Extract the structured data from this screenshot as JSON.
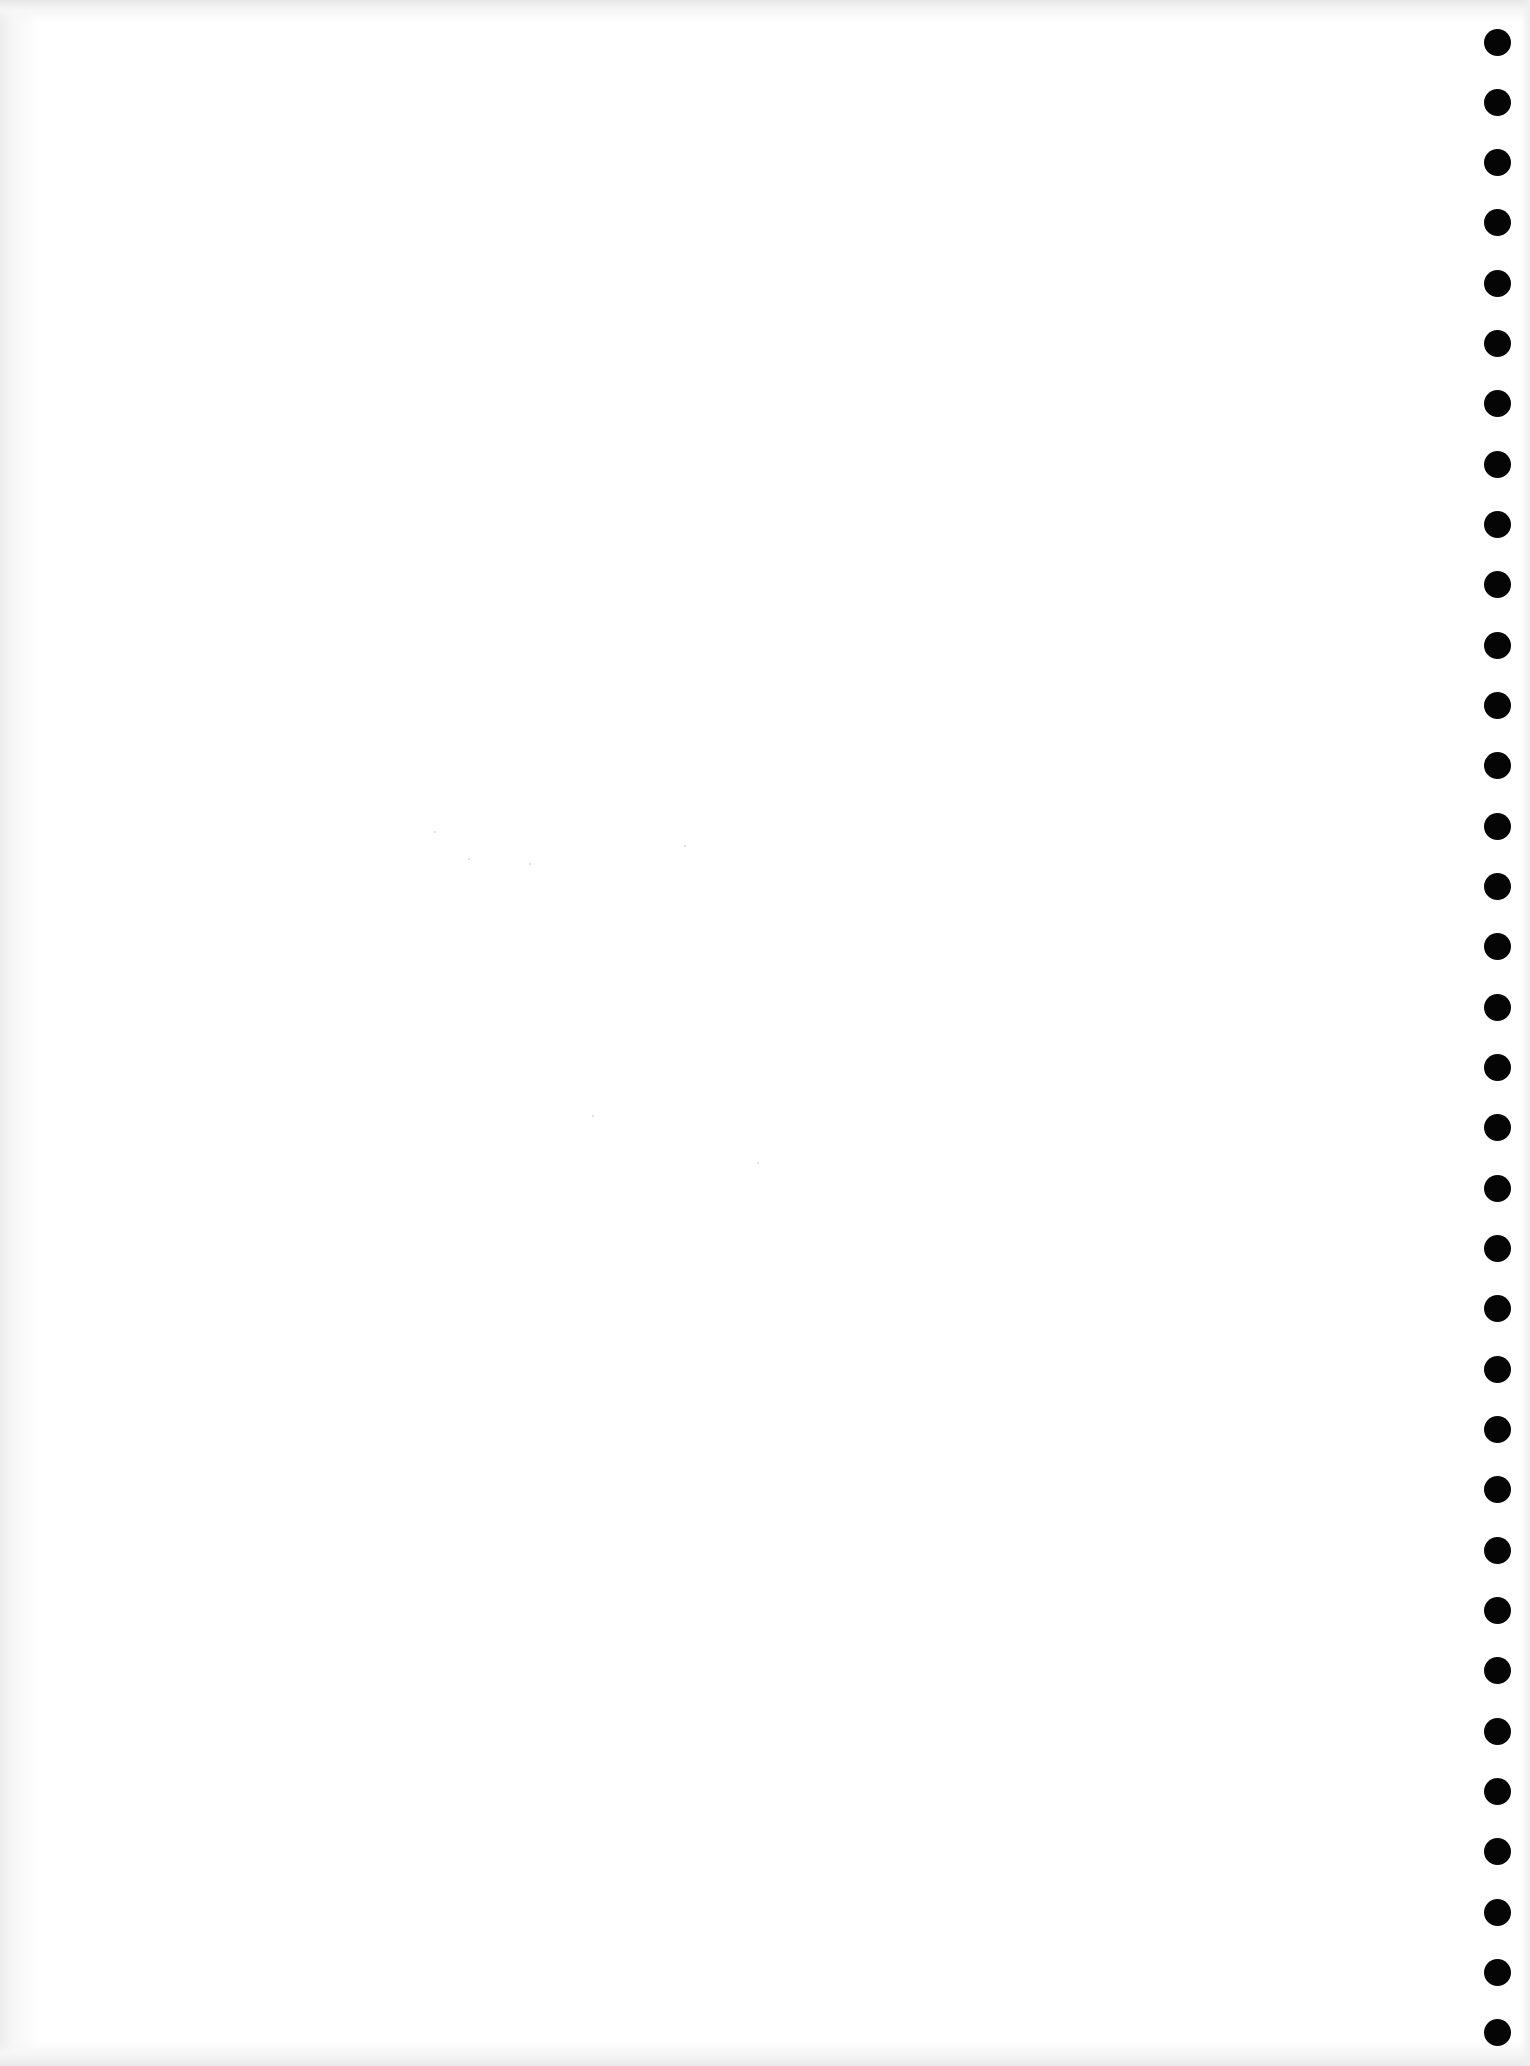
{
  "document": {
    "type": "blank tractor-feed paper page (scanned)",
    "background_color": "#ffffff",
    "edge_shading_color": "#ececec",
    "text_content": ""
  },
  "sprocket_holes": {
    "side": "right",
    "count": 34,
    "color": "#050505",
    "diameter_px": 27,
    "center_x_px": 1497,
    "first_center_y_px": 42,
    "spacing_px": 60.33
  }
}
